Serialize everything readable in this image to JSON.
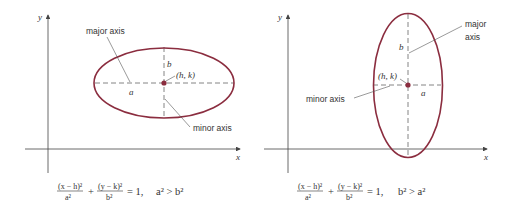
{
  "colors": {
    "ellipse": "#8B2D3F",
    "axis": "#444444",
    "dashed": "#666666",
    "text": "#333333"
  },
  "panels": [
    {
      "id": "horizontal",
      "axis_x_label": "x",
      "axis_y_label": "y",
      "major_axis_label": "major axis",
      "minor_axis_label": "minor axis",
      "semi_major_label": "a",
      "semi_minor_label": "b",
      "center_label": "(h, k)",
      "equation": {
        "term1_num": "(x − h)²",
        "term1_den": "a²",
        "plus": "+",
        "term2_num": "(y − k)²",
        "term2_den": "b²",
        "equals": "= 1,",
        "condition": "a² > b²"
      }
    },
    {
      "id": "vertical",
      "axis_x_label": "x",
      "axis_y_label": "y",
      "major_axis_label_line1": "major",
      "major_axis_label_line2": "axis",
      "minor_axis_label": "minor axis",
      "semi_major_label": "b",
      "semi_minor_label": "a",
      "center_label": "(h, k)",
      "equation": {
        "term1_num": "(x − h)²",
        "term1_den": "a²",
        "plus": "+",
        "term2_num": "(y − k)²",
        "term2_den": "b²",
        "equals": "= 1,",
        "condition": "b² > a²"
      }
    }
  ]
}
